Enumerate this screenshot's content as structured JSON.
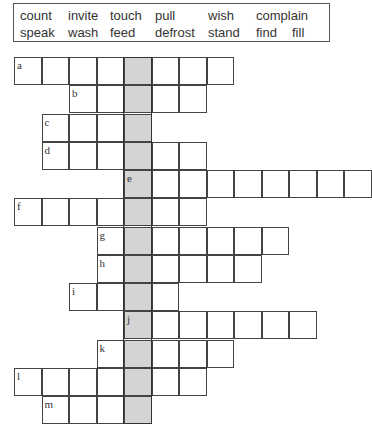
{
  "word_box": {
    "row1": [
      {
        "text": "count",
        "x": 20
      },
      {
        "text": "invite",
        "x": 68
      },
      {
        "text": "touch",
        "x": 110
      },
      {
        "text": "pull",
        "x": 155
      },
      {
        "text": "wish",
        "x": 208
      },
      {
        "text": "complain",
        "x": 256
      }
    ],
    "row2": [
      {
        "text": "speak",
        "x": 20
      },
      {
        "text": "wash",
        "x": 68
      },
      {
        "text": "feed",
        "x": 110
      },
      {
        "text": "defrost",
        "x": 155
      },
      {
        "text": "stand",
        "x": 208
      },
      {
        "text": "find",
        "x": 256
      },
      {
        "text": "fill",
        "x": 292
      }
    ]
  },
  "crossword": {
    "shaded_column": 4,
    "shade_color": "#d4d4d4",
    "rows": [
      {
        "label": "a",
        "start_col": 0,
        "end_col": 7
      },
      {
        "label": "b",
        "start_col": 2,
        "end_col": 6
      },
      {
        "label": "c",
        "start_col": 1,
        "end_col": 4
      },
      {
        "label": "d",
        "start_col": 1,
        "end_col": 6
      },
      {
        "label": "e",
        "start_col": 4,
        "end_col": 12
      },
      {
        "label": "f",
        "start_col": 0,
        "end_col": 6
      },
      {
        "label": "g",
        "start_col": 3,
        "end_col": 9
      },
      {
        "label": "h",
        "start_col": 3,
        "end_col": 8
      },
      {
        "label": "i",
        "start_col": 2,
        "end_col": 5
      },
      {
        "label": "j",
        "start_col": 4,
        "end_col": 10
      },
      {
        "label": "k",
        "start_col": 3,
        "end_col": 7
      },
      {
        "label": "l",
        "start_col": 0,
        "end_col": 6
      },
      {
        "label": "m",
        "start_col": 1,
        "end_col": 4
      }
    ]
  }
}
